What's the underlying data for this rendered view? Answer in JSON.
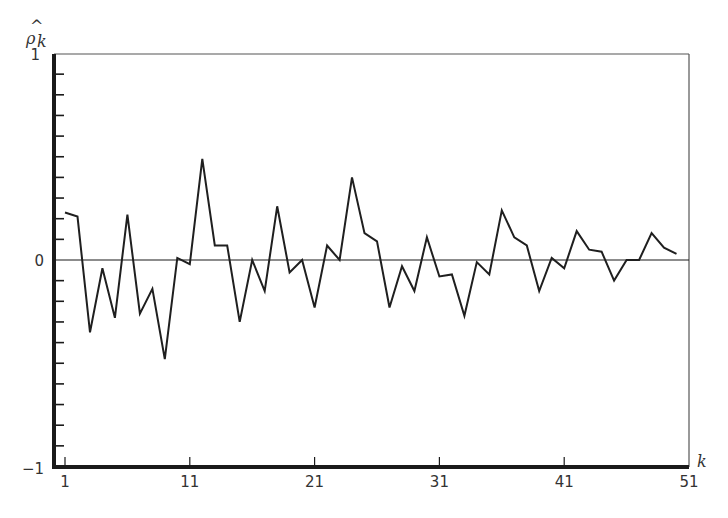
{
  "chart_data": {
    "type": "line",
    "title": "",
    "xlabel": "k",
    "ylabel": "ρ̂_k",
    "ylabel_display": {
      "main": "ρ",
      "hat": "^",
      "sub": "k"
    },
    "xlim": [
      1,
      51
    ],
    "ylim": [
      -1,
      1
    ],
    "grid": false,
    "legend": null,
    "x_ticks": [
      1,
      11,
      21,
      31,
      41,
      51
    ],
    "x_tick_labels": [
      "1",
      "11",
      "21",
      "31",
      "41",
      "51"
    ],
    "y_tick_labels": [
      {
        "value": 1,
        "label": "1"
      },
      {
        "value": 0,
        "label": "0"
      },
      {
        "value": -1,
        "label": "−1"
      }
    ],
    "y_minor_tick_step": 0.1,
    "zero_line": true,
    "x": [
      1,
      2,
      3,
      4,
      5,
      6,
      7,
      8,
      9,
      10,
      11,
      12,
      13,
      14,
      15,
      16,
      17,
      18,
      19,
      20,
      21,
      22,
      23,
      24,
      25,
      26,
      27,
      28,
      29,
      30,
      31,
      32,
      33,
      34,
      35,
      36,
      37,
      38,
      39,
      40,
      41,
      42,
      43,
      44,
      45,
      46,
      47,
      48,
      49,
      50
    ],
    "series": [
      {
        "name": "sample autocorrelation",
        "values": [
          0.23,
          0.21,
          -0.35,
          -0.04,
          -0.28,
          0.22,
          -0.26,
          -0.14,
          -0.48,
          0.01,
          -0.02,
          0.49,
          0.07,
          0.07,
          -0.3,
          0.0,
          -0.15,
          0.26,
          -0.06,
          0.0,
          -0.23,
          0.07,
          0.0,
          0.4,
          0.13,
          0.09,
          -0.23,
          -0.03,
          -0.15,
          0.11,
          -0.08,
          -0.07,
          -0.27,
          -0.01,
          -0.07,
          0.24,
          0.11,
          0.07,
          -0.15,
          0.01,
          -0.04,
          0.14,
          0.05,
          0.04,
          -0.1,
          0.0,
          0.0,
          0.13,
          0.06,
          0.03
        ]
      }
    ]
  },
  "colors": {
    "background": "#ffffff",
    "axis": "#1a1a1a",
    "line": "#1f1f1f",
    "frame": "#555555",
    "text": "#333333"
  },
  "labels": {
    "y_top": "1",
    "y_zero": "0",
    "y_bottom": "−1",
    "x_axis_var": "k",
    "y_axis_main": "ρ",
    "y_axis_hat": "^",
    "y_axis_sub": "k"
  }
}
